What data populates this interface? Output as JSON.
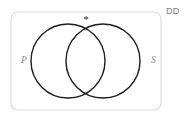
{
  "figure": {
    "type": "venn-diagram",
    "background_color": "#ffffff"
  },
  "universe": {
    "label": "DD",
    "label_position": "outside-top-right",
    "shape": "rounded-rectangle",
    "stroke_color": "#d9d9d9",
    "x": 11,
    "y": 12,
    "width": 150,
    "height": 98,
    "corner_radius": 7,
    "label_x": 166,
    "label_y": 12
  },
  "sets": [
    {
      "name": "set-p",
      "label": "P",
      "label_x": 21,
      "label_y": 61,
      "cx": 68,
      "cy": 61,
      "r": 37,
      "stroke_color": "#1c1c1c"
    },
    {
      "name": "set-s",
      "label": "S",
      "label_x": 151,
      "label_y": 61,
      "cx": 103,
      "cy": 61,
      "r": 37,
      "stroke_color": "#1c1c1c"
    }
  ],
  "markers": [
    {
      "name": "intersection-point",
      "glyph": "*",
      "x": 86,
      "y": 20,
      "color": "#262626"
    }
  ]
}
